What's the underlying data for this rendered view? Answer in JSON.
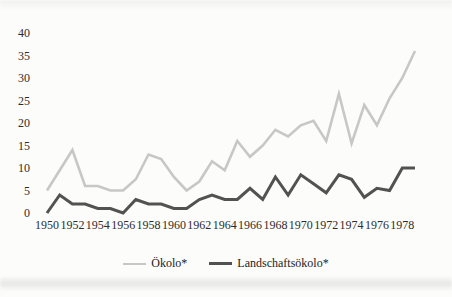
{
  "chart_data": {
    "type": "line",
    "title": "",
    "xlabel": "",
    "ylabel": "",
    "grid": false,
    "legend_position": "bottom-center",
    "ylim": [
      0,
      40
    ],
    "yticks": [
      0,
      5,
      10,
      15,
      20,
      25,
      30,
      35,
      40
    ],
    "xticks": [
      1950,
      1952,
      1954,
      1956,
      1958,
      1960,
      1962,
      1964,
      1966,
      1968,
      1970,
      1972,
      1974,
      1976,
      1978
    ],
    "x": [
      1950,
      1951,
      1952,
      1953,
      1954,
      1955,
      1956,
      1957,
      1958,
      1959,
      1960,
      1961,
      1962,
      1963,
      1964,
      1965,
      1966,
      1967,
      1968,
      1969,
      1970,
      1971,
      1972,
      1973,
      1974,
      1975,
      1976,
      1977,
      1978,
      1979
    ],
    "series": [
      {
        "name": "Ökolo*",
        "color": "#c7c7c7",
        "stroke_width": 2.6,
        "values": [
          5,
          9.5,
          14,
          6,
          6,
          5,
          5,
          7.5,
          13,
          12,
          8,
          5,
          7,
          11.5,
          9.5,
          16,
          12.5,
          15,
          18.5,
          17,
          19.5,
          20.5,
          16,
          26.5,
          15.5,
          24,
          19.5,
          25.5,
          30,
          36
        ]
      },
      {
        "name": "Landschaftsökolo*",
        "color": "#525252",
        "stroke_width": 3.0,
        "values": [
          0,
          4,
          2,
          2,
          1,
          1,
          0,
          3,
          2,
          2,
          1,
          1,
          3,
          4,
          3,
          3,
          5.5,
          3,
          8,
          4,
          8.5,
          6.5,
          4.5,
          8.5,
          7.5,
          3.5,
          5.5,
          5,
          10,
          10
        ]
      }
    ]
  },
  "legend": {
    "items": [
      {
        "label": "Ökolo*"
      },
      {
        "label": "Landschaftsökolo*"
      }
    ]
  }
}
